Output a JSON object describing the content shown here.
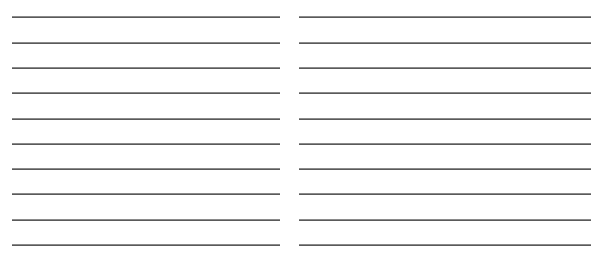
{
  "page": {
    "type": "lined-writing-sheet",
    "columns": 2,
    "lines_per_column": 10,
    "line_color": "#5a5a5a",
    "background": "#ffffff"
  },
  "columns": [
    {
      "name": "left",
      "lines": [
        16,
        42,
        67,
        92,
        118,
        143,
        168,
        193,
        219,
        244
      ]
    },
    {
      "name": "right",
      "lines": [
        16,
        42,
        67,
        92,
        118,
        143,
        168,
        193,
        219,
        244
      ]
    }
  ]
}
